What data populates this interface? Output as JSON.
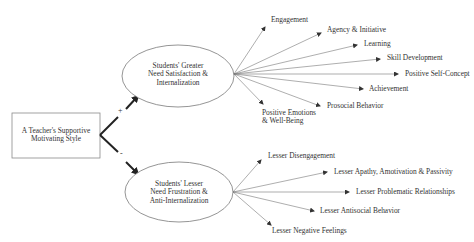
{
  "source_node": {
    "line1": "A Teacher's Supportive",
    "line2": "Motivating Style"
  },
  "positive_path": {
    "sign": "+",
    "mediator": {
      "line1": "Students' Greater",
      "line2": "Need Satisfaction &",
      "line3": "Internalization"
    },
    "outcomes": [
      {
        "label": "Engagement"
      },
      {
        "label": "Agency & Initiative"
      },
      {
        "label": "Learning"
      },
      {
        "label": "Skill Development"
      },
      {
        "label": "Positive Self-Concept"
      },
      {
        "label": "Achievement"
      },
      {
        "label": "Prosocial Behavior"
      },
      {
        "label": "Positive Emotions",
        "label2": "& Well-Being"
      }
    ]
  },
  "negative_path": {
    "sign": "-",
    "mediator": {
      "line1": "Students' Lesser",
      "line2": "Need Frustration &",
      "line3": "Anti-Internalization"
    },
    "outcomes": [
      {
        "label": "Lesser Disengagement"
      },
      {
        "label": "Lesser Apathy, Amotivation & Passivity"
      },
      {
        "label": "Lesser Problematic Relationships"
      },
      {
        "label": "Lesser Antisocial Behavior"
      },
      {
        "label": "Lesser Negative Feelings"
      }
    ]
  },
  "colors": {
    "stroke": "#6e6e6e",
    "main_arrow": "#222222",
    "text": "#333333"
  }
}
